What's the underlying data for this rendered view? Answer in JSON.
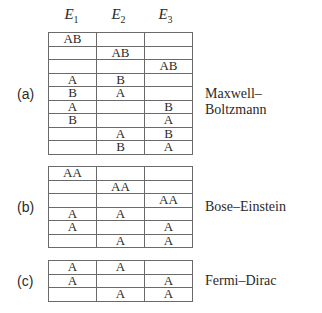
{
  "headers": [
    {
      "base": "E",
      "sub": "1"
    },
    {
      "base": "E",
      "sub": "2"
    },
    {
      "base": "E",
      "sub": "3"
    }
  ],
  "panels": [
    {
      "label": "(a)",
      "name": "Maxwell–Boltzmann",
      "rows": [
        [
          "AB",
          "",
          ""
        ],
        [
          "",
          "AB",
          ""
        ],
        [
          "",
          "",
          "AB"
        ],
        [
          "A",
          "B",
          ""
        ],
        [
          "B",
          "A",
          ""
        ],
        [
          "A",
          "",
          "B"
        ],
        [
          "B",
          "",
          "A"
        ],
        [
          "",
          "A",
          "B"
        ],
        [
          "",
          "B",
          "A"
        ]
      ]
    },
    {
      "label": "(b)",
      "name": "Bose–Einstein",
      "rows": [
        [
          "AA",
          "",
          ""
        ],
        [
          "",
          "AA",
          ""
        ],
        [
          "",
          "",
          "AA"
        ],
        [
          "A",
          "A",
          ""
        ],
        [
          "A",
          "",
          "A"
        ],
        [
          "",
          "A",
          "A"
        ]
      ]
    },
    {
      "label": "(c)",
      "name": "Fermi–Dirac",
      "rows": [
        [
          "A",
          "A",
          ""
        ],
        [
          "A",
          "",
          "A"
        ],
        [
          "",
          "A",
          "A"
        ]
      ]
    }
  ]
}
